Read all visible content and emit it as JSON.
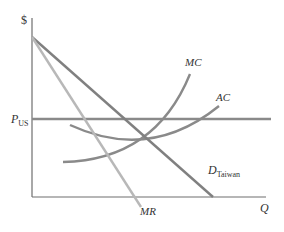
{
  "diagram": {
    "y_axis_label": "$",
    "x_axis_label": "Q",
    "price_label": {
      "main": "P",
      "sub": "US"
    },
    "curves": {
      "mc": {
        "label": "MC",
        "color": "#8a8a8a"
      },
      "ac": {
        "label": "AC",
        "color": "#8a8a8a"
      },
      "demand": {
        "label": "D",
        "sub": "Taiwan",
        "color": "#808080"
      },
      "mr": {
        "label": "MR",
        "color": "#b5b5b5"
      },
      "price_line": {
        "color": "#8a8a8a"
      }
    },
    "axis_color": "#666666"
  }
}
